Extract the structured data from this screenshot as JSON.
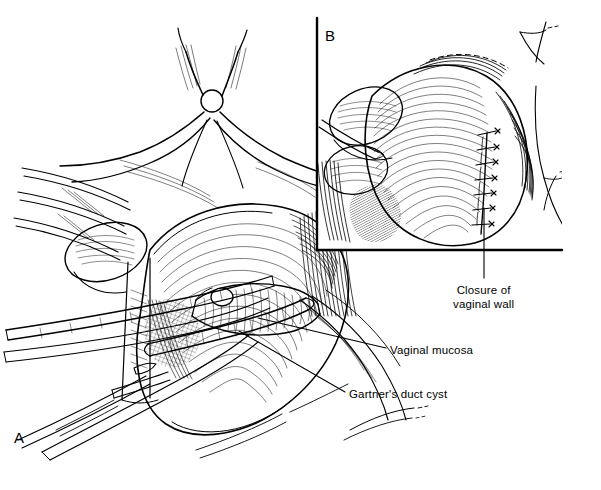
{
  "figure": {
    "type": "medical-illustration",
    "style": "pen-and-ink line drawing",
    "background_color": "#ffffff",
    "ink_color": "#000000",
    "width": 601,
    "height": 490
  },
  "panels": [
    {
      "letter": "A",
      "name": "main-operative-field",
      "description": "Surgical exposure of the vagina with retractors and forceps; the Gartner's duct cyst is dissected from the vaginal mucosa."
    },
    {
      "letter": "B",
      "name": "inset-closure",
      "description": "Inset showing the vaginal wall closed with interrupted sutures after cyst removal.",
      "frame": {
        "vertical_x": 317,
        "vertical_y_start": 18,
        "vertical_y_end": 250,
        "horizontal_y": 250,
        "horizontal_x_start": 317,
        "horizontal_x_end": 562
      },
      "suture_count": 7
    }
  ],
  "labels": [
    {
      "id": "closure",
      "line1": "Closure of",
      "line2": "vaginal wall",
      "text": "Closure of vaginal wall",
      "leader_from": [
        483,
        278
      ],
      "leader_to": [
        484,
        208
      ]
    },
    {
      "id": "mucosa",
      "text": "Vaginal mucosa",
      "leader_from": [
        388,
        348
      ],
      "leader_to": [
        258,
        318
      ]
    },
    {
      "id": "cyst",
      "text": "Gartner's duct cyst",
      "leader_from": [
        347,
        392
      ],
      "leader_to": [
        239,
        331
      ]
    }
  ]
}
